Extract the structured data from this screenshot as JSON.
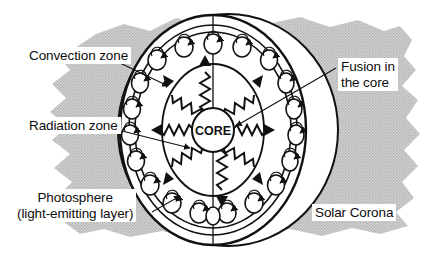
{
  "diagram": {
    "background_color": "#ffffff",
    "corona_color": "#c9c9c9",
    "line_color": "#111111",
    "label_bg": "#ffffff"
  },
  "labels": {
    "convection_zone": "Convection zone",
    "radiation_zone": "Radiation zone",
    "photosphere_line1": "Photosphere",
    "photosphere_line2": "(light-emitting layer)",
    "fusion_line1": "Fusion in",
    "fusion_line2": "the core",
    "solar_corona": "Solar Corona",
    "core": "CORE"
  },
  "structure": {
    "layers": [
      "Solar Corona",
      "Photosphere (light-emitting layer)",
      "Convection zone",
      "Radiation zone",
      "Core"
    ],
    "convection_cell_count": 20,
    "radiation_ray_count": 8
  }
}
